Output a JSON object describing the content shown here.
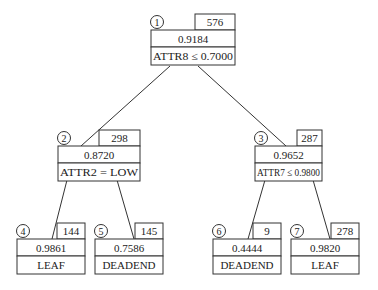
{
  "colors": {
    "line": "#333333",
    "text": "#222222",
    "background": "#ffffff"
  },
  "nodes": [
    {
      "id": "1",
      "count": "576",
      "value": "0.9184",
      "label": "ATTR8 ≤ 0.7000",
      "x": 151,
      "w": 84,
      "cw": 40,
      "top": 30
    },
    {
      "id": "2",
      "count": "298",
      "value": "0.8720",
      "label": "ATTR2 = LOW",
      "x": 58,
      "w": 82,
      "cw": 41,
      "top": 146
    },
    {
      "id": "3",
      "count": "287",
      "value": "0.9652",
      "label": "ATTR7 ≤ 0.9800",
      "x": 255,
      "w": 67,
      "cw": 25,
      "top": 146
    },
    {
      "id": "4",
      "count": "144",
      "value": "0.9861",
      "label": "LEAF",
      "x": 17,
      "w": 68,
      "cw": 28,
      "top": 239
    },
    {
      "id": "5",
      "count": "145",
      "value": "0.7586",
      "label": "DEADEND",
      "x": 95,
      "w": 68,
      "cw": 28,
      "top": 239
    },
    {
      "id": "6",
      "count": "9",
      "value": "0.4444",
      "label": "DEADEND",
      "x": 213,
      "w": 68,
      "cw": 28,
      "top": 239
    },
    {
      "id": "7",
      "count": "278",
      "value": "0.9820",
      "label": "LEAF",
      "x": 291,
      "w": 68,
      "cw": 28,
      "top": 239
    }
  ],
  "edges": [
    {
      "from": "1",
      "to": "2",
      "x1": 170,
      "y1": 66,
      "x2": 81,
      "y2": 146
    },
    {
      "from": "1",
      "to": "3",
      "x1": 198,
      "y1": 66,
      "x2": 286,
      "y2": 146
    },
    {
      "from": "2",
      "to": "4",
      "x1": 67,
      "y1": 180,
      "x2": 52,
      "y2": 239
    },
    {
      "from": "2",
      "to": "5",
      "x1": 117,
      "y1": 180,
      "x2": 134,
      "y2": 239
    },
    {
      "from": "3",
      "to": "6",
      "x1": 265,
      "y1": 180,
      "x2": 248,
      "y2": 239
    },
    {
      "from": "3",
      "to": "7",
      "x1": 313,
      "y1": 180,
      "x2": 330,
      "y2": 239
    }
  ]
}
